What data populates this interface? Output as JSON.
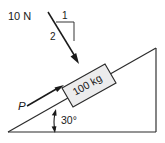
{
  "figure": {
    "background_color": "#ffffff",
    "line_color": "#2a2a2a",
    "block_fill_color": "#ececed",
    "applied_force": {
      "magnitude_label": "10 N",
      "direction": "down-and-right into block",
      "slope_triangle": {
        "rise_label": "1",
        "run_label": "2",
        "description": "1 horizontal to 2 along the force line"
      }
    },
    "block": {
      "mass_label": "100 kg",
      "shape": "rectangle tilted along incline"
    },
    "push_force": {
      "label": "P",
      "direction": "up the incline"
    },
    "incline": {
      "angle_label": "30°",
      "shape": "right triangle, rises left to right"
    }
  }
}
